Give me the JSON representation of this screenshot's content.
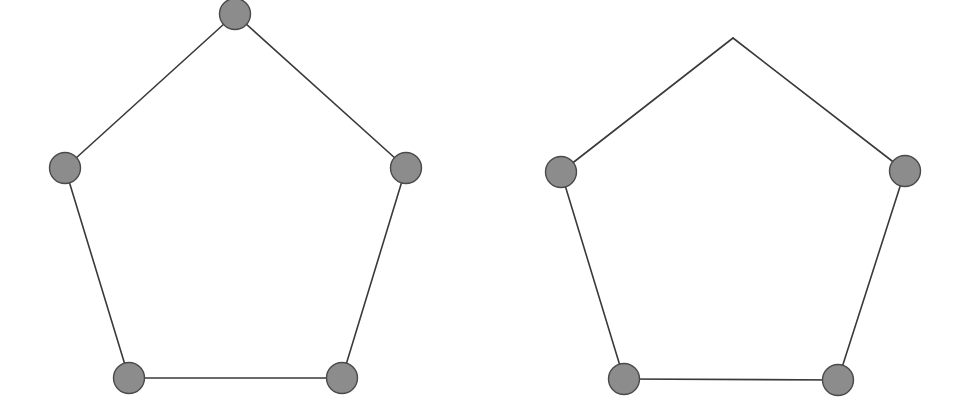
{
  "diagram": {
    "graphs": [
      {
        "name": "left-pentagon",
        "vertices": [
          "top",
          "upper-left",
          "upper-right",
          "lower-left",
          "lower-right"
        ],
        "nodes_drawn": [
          "top",
          "upper-left",
          "upper-right",
          "lower-left",
          "lower-right"
        ],
        "edges": [
          [
            "top",
            "upper-right"
          ],
          [
            "upper-right",
            "lower-right"
          ],
          [
            "lower-right",
            "lower-left"
          ],
          [
            "lower-left",
            "upper-left"
          ],
          [
            "upper-left",
            "top"
          ]
        ]
      },
      {
        "name": "right-pentagon",
        "vertices": [
          "top",
          "upper-left",
          "upper-right",
          "lower-left",
          "lower-right"
        ],
        "nodes_drawn": [
          "upper-left",
          "upper-right",
          "lower-left",
          "lower-right"
        ],
        "edges": [
          [
            "top",
            "upper-right"
          ],
          [
            "upper-right",
            "lower-right"
          ],
          [
            "lower-right",
            "lower-left"
          ],
          [
            "lower-left",
            "upper-left"
          ],
          [
            "upper-left",
            "top"
          ]
        ]
      }
    ],
    "colors": {
      "node_fill": "#8c8c8c",
      "node_stroke": "#4a4a4a",
      "edge": "#3a3a3a",
      "background": "#ffffff"
    }
  }
}
